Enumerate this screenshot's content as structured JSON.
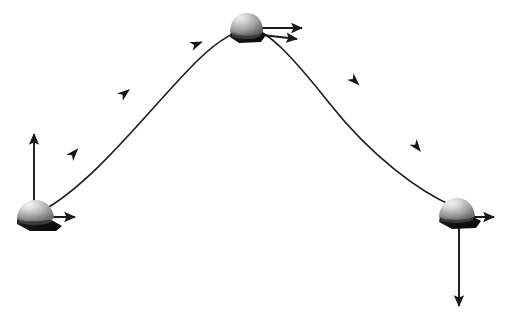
{
  "figure": {
    "background_color": "#ffffff",
    "width": 521,
    "height": 323,
    "stroke_color": "#1a1a1a",
    "stroke_width": 1.6
  },
  "chart_data": {
    "type": "line",
    "subtitle": "",
    "xlabel": "",
    "ylabel": "",
    "xlim": [
      0,
      521
    ],
    "ylim": [
      323,
      0
    ],
    "grid": false,
    "legend": null,
    "axis_visible": false,
    "tick_labels_x": [],
    "tick_labels_y": [],
    "series": [
      {
        "name": "trajectory",
        "kind": "parabolic-arc",
        "description": "Parabolic flight path from launch point rising to apex then descending to landing point",
        "x": [
          42,
          74,
          125,
          196,
          245,
          300,
          355,
          417,
          452
        ],
        "y": [
          210,
          153,
          93,
          44,
          30,
          44,
          80,
          146,
          205
        ],
        "apex": [
          245,
          30
        ],
        "start": [
          42,
          210
        ],
        "end": [
          452,
          205
        ],
        "color": "#1a1a1a",
        "linewidth": 1.6
      }
    ],
    "annotations": [
      {
        "name": "direction-marker-1",
        "type": "arrowhead-on-path",
        "x": 74,
        "y": 153,
        "angle_deg": -48,
        "meaning": "direction of travel along trajectory"
      },
      {
        "name": "direction-marker-2",
        "type": "arrowhead-on-path",
        "x": 125,
        "y": 93,
        "angle_deg": -38,
        "meaning": "direction of travel along trajectory"
      },
      {
        "name": "direction-marker-3",
        "type": "arrowhead-on-path",
        "x": 196,
        "y": 44,
        "angle_deg": -20,
        "meaning": "direction of travel along trajectory"
      },
      {
        "name": "direction-marker-4",
        "type": "arrowhead-on-path",
        "x": 355,
        "y": 80,
        "angle_deg": 42,
        "meaning": "direction of travel along trajectory"
      },
      {
        "name": "direction-marker-5",
        "type": "arrowhead-on-path",
        "x": 417,
        "y": 146,
        "angle_deg": 52,
        "meaning": "direction of travel along trajectory"
      }
    ],
    "objects": [
      {
        "name": "projectile-launch",
        "position": [
          36,
          215
        ],
        "stage": "launch",
        "shape": "shaded dome with dark base",
        "vectors": [
          {
            "name": "vertical-velocity-up",
            "from": [
              34,
              213
            ],
            "to": [
              34,
              131
            ],
            "direction": "up",
            "length_px": 82
          },
          {
            "name": "horizontal-velocity-right",
            "from": [
              38,
              217
            ],
            "to": [
              78,
              217
            ],
            "direction": "right",
            "length_px": 40
          }
        ]
      },
      {
        "name": "projectile-apex",
        "position": [
          245,
          30
        ],
        "stage": "apex",
        "shape": "shaded dome with dark base",
        "vectors": [
          {
            "name": "horizontal-velocity-right-upper",
            "from": [
              258,
              28
            ],
            "to": [
              305,
              28
            ],
            "direction": "right",
            "length_px": 47
          },
          {
            "name": "tangential-velocity-right-lower",
            "from": [
              256,
              34
            ],
            "to": [
              300,
              39
            ],
            "direction": "right-slightly-down",
            "length_px": 44
          }
        ]
      },
      {
        "name": "projectile-landing",
        "position": [
          458,
          213
        ],
        "stage": "landing",
        "shape": "shaded dome with dark base",
        "vectors": [
          {
            "name": "horizontal-velocity-right",
            "from": [
              460,
              217
            ],
            "to": [
              497,
              217
            ],
            "direction": "right",
            "length_px": 37
          },
          {
            "name": "vertical-velocity-down",
            "from": [
              459,
              218
            ],
            "to": [
              459,
              311
            ],
            "direction": "down",
            "length_px": 93
          }
        ]
      }
    ]
  },
  "labels": {
    "items": []
  }
}
